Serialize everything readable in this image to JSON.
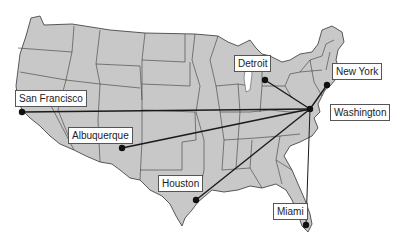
{
  "map": {
    "region": "United States",
    "colors": {
      "land": "#c8c8c8",
      "borders": "#3a3a3a",
      "routes": "#1a1a1a",
      "background": "#ffffff"
    },
    "hub": "Washington",
    "cities": [
      {
        "name": "San Francisco",
        "x": 22,
        "y": 112,
        "label_x": 15,
        "label_y": 90
      },
      {
        "name": "Albuquerque",
        "x": 122,
        "y": 148,
        "label_x": 68,
        "label_y": 127
      },
      {
        "name": "Houston",
        "x": 196,
        "y": 200,
        "label_x": 158,
        "label_y": 175
      },
      {
        "name": "Detroit",
        "x": 265,
        "y": 80,
        "label_x": 234,
        "label_y": 55
      },
      {
        "name": "New York",
        "x": 327,
        "y": 85,
        "label_x": 332,
        "label_y": 63
      },
      {
        "name": "Washington",
        "x": 310,
        "y": 109,
        "label_x": 330,
        "label_y": 104
      },
      {
        "name": "Miami",
        "x": 306,
        "y": 225,
        "label_x": 273,
        "label_y": 203
      }
    ]
  },
  "labels": {
    "sf": "San Francisco",
    "abq": "Albuquerque",
    "hou": "Houston",
    "det": "Detroit",
    "ny": "New York",
    "dc": "Washington",
    "mia": "Miami"
  }
}
